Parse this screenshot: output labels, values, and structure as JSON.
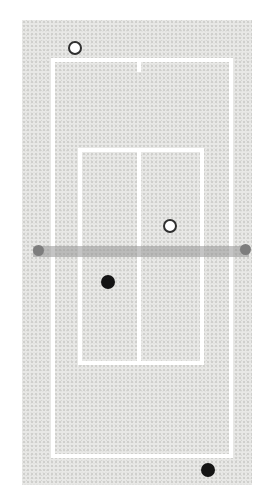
{
  "diagram": {
    "type": "tennis-court-top-view",
    "page_background": "#ffffff",
    "court_fill": "#e8e8e6",
    "line_color": "#ffffff",
    "net_color": "rgba(148,148,148,0.55)",
    "net_post_color": "#7d7d7d",
    "marker_open_fill": "#ffffff",
    "marker_open_stroke": "#2f2f2f",
    "marker_filled_color": "#141414"
  },
  "court": {
    "surface": {
      "x": 22,
      "y": 20,
      "w": 230,
      "h": 465
    },
    "outer_boundary": {
      "x": 51,
      "y": 58,
      "w": 182,
      "h": 400
    },
    "service_box": {
      "x": 78,
      "y": 148,
      "w": 126,
      "h": 217
    },
    "center_service_line": {
      "x": 137,
      "y": 148,
      "h": 217
    },
    "center_mark": {
      "x": 137,
      "y": 60,
      "h": 12
    },
    "net": {
      "x": 33,
      "y": 246,
      "w": 216,
      "h": 11
    },
    "net_posts": [
      {
        "cx": 38,
        "cy": 250
      },
      {
        "cx": 245,
        "cy": 249
      }
    ]
  },
  "markers": [
    {
      "id": "open-marker-top-left",
      "kind": "open",
      "x": 75,
      "y": 48,
      "r": 7
    },
    {
      "id": "open-marker-right-service",
      "kind": "open",
      "x": 170,
      "y": 226,
      "r": 7
    },
    {
      "id": "filled-marker-left-service",
      "kind": "filled",
      "x": 108,
      "y": 282,
      "r": 7
    },
    {
      "id": "filled-marker-bottom-right",
      "kind": "filled",
      "x": 208,
      "y": 470,
      "r": 7
    }
  ]
}
